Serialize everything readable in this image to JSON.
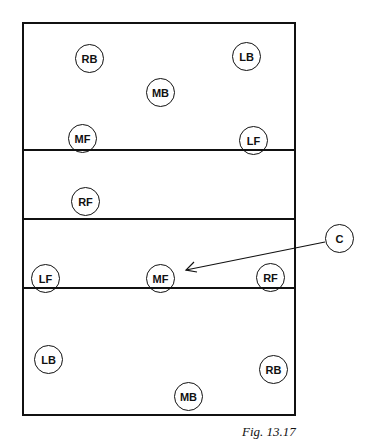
{
  "figure": {
    "caption": "Fig. 13.17",
    "court": {
      "left": 22,
      "top": 22,
      "width": 274,
      "height": 394
    },
    "lines": [
      {
        "y": 149
      },
      {
        "y": 218
      },
      {
        "y": 287
      }
    ],
    "players": [
      {
        "label": "RB",
        "x": 89,
        "y": 58,
        "group": "top"
      },
      {
        "label": "LB",
        "x": 246,
        "y": 56,
        "group": "top"
      },
      {
        "label": "MB",
        "x": 160,
        "y": 92,
        "group": "top"
      },
      {
        "label": "MF",
        "x": 82,
        "y": 138,
        "group": "top"
      },
      {
        "label": "LF",
        "x": 253,
        "y": 140,
        "group": "top"
      },
      {
        "label": "RF",
        "x": 85,
        "y": 201,
        "group": "top"
      },
      {
        "label": "LF",
        "x": 45,
        "y": 278,
        "group": "bottom"
      },
      {
        "label": "MF",
        "x": 160,
        "y": 278,
        "group": "bottom"
      },
      {
        "label": "RF",
        "x": 270,
        "y": 277,
        "group": "bottom"
      },
      {
        "label": "LB",
        "x": 48,
        "y": 359,
        "group": "bottom"
      },
      {
        "label": "RB",
        "x": 273,
        "y": 369,
        "group": "bottom"
      },
      {
        "label": "MB",
        "x": 188,
        "y": 396,
        "group": "bottom"
      }
    ],
    "callout": {
      "label": "C",
      "x": 339,
      "y": 238,
      "arrow_to": {
        "x": 184,
        "y": 270
      }
    }
  }
}
